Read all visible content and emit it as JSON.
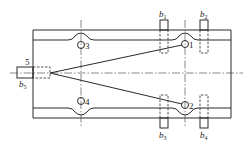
{
  "diagram": {
    "type": "fixture-schematic",
    "hole_labels": [
      "1",
      "2",
      "3",
      "4"
    ],
    "pin_label": "5",
    "support_labels": {
      "b1": {
        "base": "b",
        "sub": "1"
      },
      "b2": {
        "base": "b",
        "sub": "2"
      },
      "b3": {
        "base": "b",
        "sub": "3"
      },
      "b4": {
        "base": "b",
        "sub": "4"
      },
      "b5": {
        "base": "b",
        "sub": "5"
      }
    }
  }
}
